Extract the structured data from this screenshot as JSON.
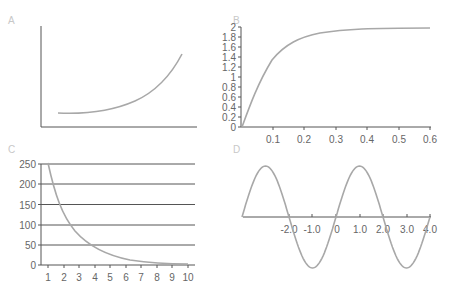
{
  "chart_data": [
    {
      "panel": "A",
      "type": "line",
      "title": "",
      "xlabel": "",
      "ylabel": "",
      "x": [
        0,
        1,
        2,
        3,
        4,
        5,
        6,
        7,
        8
      ],
      "values": [
        13,
        13.5,
        15,
        18,
        22,
        28,
        36,
        47,
        60
      ],
      "grid": false,
      "note": "No tick labels; exponential-growth shape"
    },
    {
      "panel": "B",
      "type": "line",
      "title": "",
      "xlabel": "",
      "ylabel": "",
      "x_ticks": [
        "0.1",
        "0.2",
        "0.3",
        "0.4",
        "0.5",
        "0.6"
      ],
      "y_ticks": [
        "0",
        "0.2",
        "0.4",
        "0.6",
        "0.8",
        "1",
        "1.2",
        "1.4",
        "1.6",
        "1.8",
        "2"
      ],
      "xlim": [
        0,
        0.6
      ],
      "ylim": [
        0,
        2
      ],
      "x": [
        0,
        0.05,
        0.1,
        0.15,
        0.2,
        0.25,
        0.3,
        0.35,
        0.4,
        0.45,
        0.5,
        0.55,
        0.6
      ],
      "values": [
        0,
        0.9,
        1.35,
        1.6,
        1.76,
        1.85,
        1.91,
        1.94,
        1.96,
        1.97,
        1.98,
        1.98,
        1.98
      ],
      "grid": false
    },
    {
      "panel": "C",
      "type": "line",
      "title": "",
      "xlabel": "",
      "ylabel": "",
      "x_ticks": [
        "1",
        "2",
        "3",
        "4",
        "5",
        "6",
        "7",
        "8",
        "9",
        "10"
      ],
      "y_ticks": [
        "0",
        "50",
        "100",
        "150",
        "200",
        "250"
      ],
      "xlim": [
        1,
        10
      ],
      "ylim": [
        0,
        250
      ],
      "x": [
        1,
        2,
        3,
        4,
        5,
        6,
        7,
        8,
        9,
        10
      ],
      "values": [
        250,
        124,
        62,
        31,
        15,
        8,
        4,
        2,
        1,
        0.5
      ],
      "grid": true,
      "grid_axis": "y"
    },
    {
      "panel": "D",
      "type": "line",
      "title": "",
      "xlabel": "",
      "ylabel": "",
      "x_ticks": [
        "-2.0",
        "-1.0",
        "0",
        "1.0",
        "2.0",
        "3.0",
        "4.0"
      ],
      "xlim": [
        -4,
        4
      ],
      "ylim": [
        -1,
        1
      ],
      "function": "sin(pi*x/2)",
      "x": [
        -4,
        -3,
        -2,
        -1,
        0,
        1,
        2,
        3,
        4
      ],
      "values": [
        0,
        1,
        0,
        -1,
        0,
        1,
        0,
        -1,
        0
      ],
      "grid": false
    }
  ],
  "panels": {
    "a": {
      "label": "A"
    },
    "b": {
      "label": "B",
      "y_ticks": [
        "0",
        "0.2",
        "0.4",
        "0.6",
        "0.8",
        "1",
        "1.2",
        "1.4",
        "1.6",
        "1.8",
        "2"
      ],
      "x_ticks": [
        "0.1",
        "0.2",
        "0.3",
        "0.4",
        "0.5",
        "0.6"
      ]
    },
    "c": {
      "label": "C",
      "y_ticks": [
        "0",
        "50",
        "100",
        "150",
        "200",
        "250"
      ],
      "x_ticks": [
        "1",
        "2",
        "3",
        "4",
        "5",
        "6",
        "7",
        "8",
        "9",
        "10"
      ]
    },
    "d": {
      "label": "D",
      "x_ticks": [
        "-2.0",
        "-1.0",
        "0",
        "1.0",
        "2.0",
        "3.0",
        "4.0"
      ]
    }
  },
  "colors": {
    "axis": "#555555",
    "curve": "#a8a8a8",
    "label": "#c8c8c8",
    "tick_text": "#666666"
  }
}
